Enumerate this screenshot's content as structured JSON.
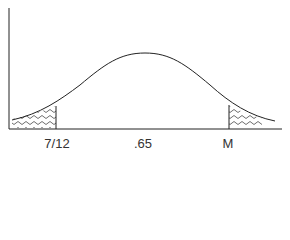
{
  "diagram": {
    "type": "normal-distribution-curve",
    "peak_label": ".65",
    "left_bound_label": "7/12",
    "right_bound_label": "M",
    "shaded_regions": [
      "left-tail",
      "right-tail"
    ],
    "colors": {
      "line": "#222222",
      "background": "#ffffff",
      "shade": "#333333"
    }
  },
  "labels": [
    {
      "text": "7/12",
      "x": 57
    },
    {
      "text": ".65",
      "x": 143
    },
    {
      "text": "M",
      "x": 228
    }
  ]
}
